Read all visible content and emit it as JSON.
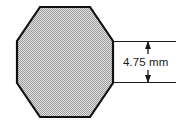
{
  "figure": {
    "shape": {
      "name": "regular-octagon",
      "fill_color": "#c9c9c9",
      "fill_pattern": "stipple-halftone",
      "stroke_color": "#111111",
      "stroke_width": 2.2,
      "vertices": [
        [
          40,
          7
        ],
        [
          90,
          7
        ],
        [
          113,
          41
        ],
        [
          113,
          83
        ],
        [
          90,
          117
        ],
        [
          40,
          117
        ],
        [
          17,
          83
        ],
        [
          17,
          41
        ]
      ]
    },
    "dimension": {
      "label": "4.75 mm",
      "value": 4.75,
      "unit": "mm",
      "measures": "right-vertical-side",
      "orientation": "vertical",
      "line_color": "#1a1a1a",
      "extension_top_y": 41,
      "extension_bottom_y": 83,
      "dimension_line_x": 148,
      "extension_start_x": 114,
      "extension_end_x": 176,
      "arrow_style": "filled-triangle-both-ends"
    },
    "background_color": "#ffffff"
  }
}
